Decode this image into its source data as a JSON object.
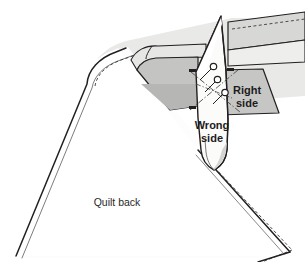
{
  "illustration": {
    "title": "Quilt binding corner fold diagram",
    "type": "line-art-instructional-diagram",
    "background_color": "#ffffff"
  },
  "labels": {
    "quilt_back": "Quilt back",
    "wrong_side_line1": "Wrong",
    "wrong_side_line2": "side",
    "right_side_line1": "Right",
    "right_side_line2": "side"
  },
  "colors": {
    "outline": "#231f20",
    "quilt_back_fill": "#fdfdfd",
    "quilt_top_fill": "#e8e8e6",
    "binding_light_fill": "#e2e2e0",
    "binding_mid_fill": "#c9c9c7",
    "binding_dark_fill": "#b4b4b2",
    "flap_fill": "#fbfbfa",
    "stitch_line": "#3a3a3a",
    "text_color": "#1c1c1c",
    "pin_fill": "#ffffff"
  },
  "elements": {
    "quilt_back_panel": "large light panel occupying lower-left, bounded by curved top-left edge and diagonal lower-right edge",
    "quilt_top_panel": "light gray panel along upper and right side of the quilt",
    "binding_strip_top_right": "light gray binding strip running to the upper-right corner with dashed stitch line",
    "binding_flap_left": "medium gray quadrilateral binding flap left of center",
    "binding_flap_right": "medium gray trapezoid binding flap right of center labelled Right side",
    "center_flap": "near-white vertical folded binding tail running top to bottom through the middle, labelled Wrong side",
    "pins": "three open-circle straight pins crossing the center flap diagonally",
    "stitch_lines": "dashed seam lines along quilt edge, upper-right binding and lower-right corner",
    "fold_guides": "dash-dot diagonal fold guide lines forming an X over the center flap"
  }
}
